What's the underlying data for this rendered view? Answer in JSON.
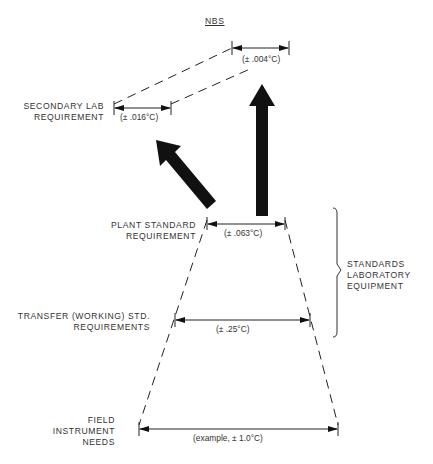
{
  "diagram": {
    "top_label": "NBS",
    "levels": [
      {
        "id": "nbs",
        "label_lines": [],
        "tolerance": "(± .004°C)"
      },
      {
        "id": "secondary-lab",
        "label_lines": [
          "SECONDARY LAB",
          "REQUIREMENT"
        ],
        "tolerance": "(± .016°C)"
      },
      {
        "id": "plant-standard",
        "label_lines": [
          "PLANT STANDARD",
          "REQUIREMENT"
        ],
        "tolerance": "(± .063°C)"
      },
      {
        "id": "transfer",
        "label_lines": [
          "TRANSFER (WORKING) STD.",
          "REQUIREMENTS"
        ],
        "tolerance": "(± .25°C)"
      },
      {
        "id": "field",
        "label_lines": [
          "FIELD",
          "INSTRUMENT",
          "NEEDS"
        ],
        "tolerance": "(example, ± 1.0°C)"
      }
    ],
    "bracket_label_lines": [
      "STANDARDS",
      "LABORATORY",
      "EQUIPMENT"
    ],
    "colors": {
      "ink": "#111111",
      "text": "#333333",
      "background": "#ffffff"
    }
  }
}
